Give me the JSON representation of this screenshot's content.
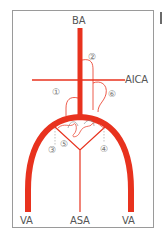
{
  "diagram": {
    "colors": {
      "artery": "#e8321e",
      "branch": "#e8321e",
      "dashed": "#999999",
      "label": "#555555",
      "frame": "#9a9a9a"
    },
    "labels": {
      "ba": "BA",
      "aica": "AICA",
      "va_left": "VA",
      "asa": "ASA",
      "va_right": "VA"
    },
    "markers": [
      "①",
      "②",
      "③",
      "④",
      "⑤",
      "⑥"
    ]
  }
}
